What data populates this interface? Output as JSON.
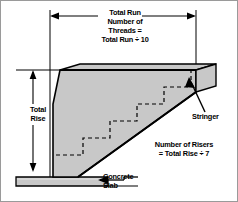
{
  "diagram": {
    "colors": {
      "stroke": "#000000",
      "fill": "#c8c8c8",
      "fill_dark": "#b4b4b4",
      "background": "#ffffff",
      "dashed": "#000000"
    }
  },
  "labels": {
    "total_run": {
      "line1": "Total Run",
      "line2": "Number of",
      "line3": "Threads =",
      "line4": "Total Run ÷ 10"
    },
    "total_rise": {
      "line1": "Total",
      "line2": "Rise"
    },
    "stringer": {
      "text": "Stringer"
    },
    "risers": {
      "line1": "Number of Risers",
      "line2": "= Total Rise ÷ 7"
    },
    "concrete_slab": {
      "line1": "Concrete",
      "line2": "Slab"
    }
  },
  "dimensions": {
    "run_line": {
      "x_start": 50,
      "x_end": 196,
      "y": 16,
      "arrows": "both"
    },
    "rise_line": {
      "x": 33,
      "y_start": 70,
      "y_end": 172,
      "arrows": "both"
    }
  },
  "geometry": {
    "step_count": 5,
    "stringer_top_y": 70,
    "stringer_base_y": 176,
    "slab_top_y": 177,
    "slab_bottom_y": 186,
    "slab_x_start": 16,
    "slab_x_end": 108
  }
}
